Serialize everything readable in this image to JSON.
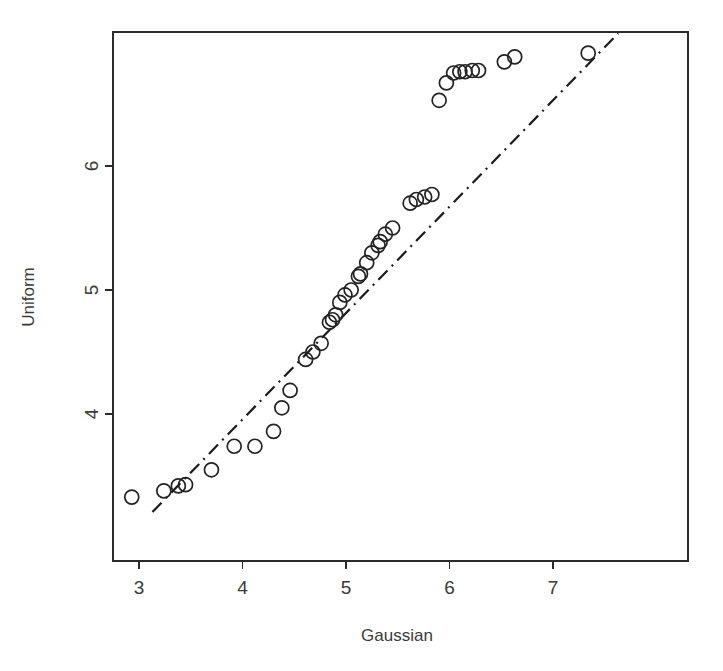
{
  "chart_data": {
    "type": "scatter",
    "title": "",
    "xlabel": "Gaussian",
    "ylabel": "Uniform",
    "xlim": [
      2.75,
      8.3
    ],
    "ylim": [
      3.2,
      10.3
    ],
    "xticks": [
      3,
      4,
      5,
      6,
      7
    ],
    "xtick_labels": [
      "3",
      "4",
      "5",
      "6",
      "7"
    ],
    "yticks": [
      4,
      5,
      6
    ],
    "ytick_labels": [
      "4",
      "5",
      "6"
    ],
    "grid": false,
    "legend": null,
    "marker": "open-circle",
    "marker_radius_px": 7,
    "points": [
      [
        2.93,
        3.33
      ],
      [
        3.24,
        3.38
      ],
      [
        3.38,
        3.42
      ],
      [
        3.45,
        3.43
      ],
      [
        3.7,
        3.55
      ],
      [
        3.92,
        3.74
      ],
      [
        4.12,
        3.74
      ],
      [
        4.3,
        3.86
      ],
      [
        4.38,
        4.05
      ],
      [
        4.46,
        4.19
      ],
      [
        4.61,
        4.44
      ],
      [
        4.68,
        4.5
      ],
      [
        4.76,
        4.57
      ],
      [
        4.84,
        4.74
      ],
      [
        4.87,
        4.76
      ],
      [
        4.9,
        4.8
      ],
      [
        4.94,
        4.9
      ],
      [
        4.99,
        4.96
      ],
      [
        5.05,
        5.0
      ],
      [
        5.12,
        5.11
      ],
      [
        5.14,
        5.13
      ],
      [
        5.2,
        5.22
      ],
      [
        5.25,
        5.3
      ],
      [
        5.31,
        5.36
      ],
      [
        5.33,
        5.39
      ],
      [
        5.38,
        5.45
      ],
      [
        5.45,
        5.5
      ],
      [
        5.62,
        5.7
      ],
      [
        5.68,
        5.73
      ],
      [
        5.76,
        5.75
      ],
      [
        5.83,
        5.77
      ],
      [
        5.9,
        6.53
      ],
      [
        5.97,
        6.67
      ],
      [
        6.04,
        6.75
      ],
      [
        6.1,
        6.76
      ],
      [
        6.15,
        6.76
      ],
      [
        6.22,
        6.77
      ],
      [
        6.28,
        6.77
      ],
      [
        6.53,
        6.84
      ],
      [
        6.63,
        6.88
      ],
      [
        7.34,
        6.91
      ]
    ],
    "reference_line": {
      "style": "dash-dot",
      "x0": 3.13,
      "y0": 3.21,
      "x1": 7.63,
      "y1": 7.07
    }
  },
  "axis": {
    "x_title": "Gaussian",
    "y_title": "Uniform"
  }
}
